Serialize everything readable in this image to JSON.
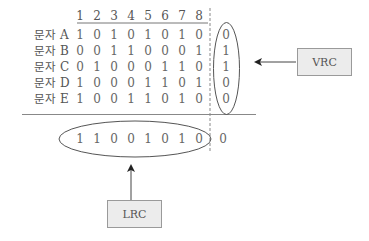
{
  "diagram": {
    "title": "",
    "column_headers": [
      "1",
      "2",
      "3",
      "4",
      "5",
      "6",
      "7",
      "8"
    ],
    "rows": [
      {
        "label_prefix": "문자",
        "label_letter": "A",
        "bits": [
          "1",
          "0",
          "1",
          "0",
          "1",
          "0",
          "1",
          "0"
        ],
        "vrc": "0"
      },
      {
        "label_prefix": "문자",
        "label_letter": "B",
        "bits": [
          "0",
          "0",
          "1",
          "1",
          "0",
          "0",
          "0",
          "1"
        ],
        "vrc": "1"
      },
      {
        "label_prefix": "문자",
        "label_letter": "C",
        "bits": [
          "0",
          "1",
          "0",
          "0",
          "0",
          "1",
          "1",
          "0"
        ],
        "vrc": "1"
      },
      {
        "label_prefix": "문자",
        "label_letter": "D",
        "bits": [
          "1",
          "0",
          "0",
          "0",
          "1",
          "1",
          "0",
          "1"
        ],
        "vrc": "0"
      },
      {
        "label_prefix": "문자",
        "label_letter": "E",
        "bits": [
          "1",
          "0",
          "0",
          "1",
          "1",
          "0",
          "1",
          "0"
        ],
        "vrc": "0"
      }
    ],
    "lrc_row": {
      "bits": [
        "1",
        "1",
        "0",
        "0",
        "1",
        "0",
        "1",
        "0"
      ],
      "parity": "0"
    },
    "labels": {
      "vrc_box": "VRC",
      "lrc_box": "LRC"
    },
    "colors": {
      "line": "#888888",
      "text": "#555555",
      "box_fill": "#ececec",
      "box_border": "#9a9a9a"
    }
  }
}
